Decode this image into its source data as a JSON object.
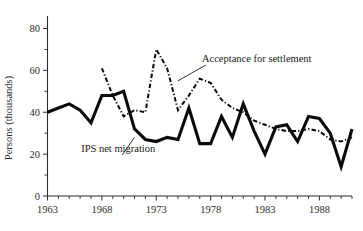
{
  "chart_data": {
    "type": "line",
    "title": "",
    "subtitle": "",
    "xlabel": "",
    "ylabel": "Persons (thousands)",
    "xlim": [
      1963,
      1991
    ],
    "ylim": [
      0,
      85
    ],
    "y_ticks_major": [
      0,
      20,
      40,
      60,
      80
    ],
    "y_ticks_minor": [
      10,
      30,
      50,
      70
    ],
    "y_tick_labels": [
      "0",
      "20",
      "40",
      "60",
      "80"
    ],
    "x_ticks_major": [
      1963,
      1968,
      1973,
      1978,
      1983,
      1988
    ],
    "x_tick_labels": [
      "1963",
      "1968",
      "1973",
      "1978",
      "1983",
      "1988"
    ],
    "x_ticks_minor": [
      1964,
      1965,
      1966,
      1967,
      1969,
      1970,
      1971,
      1972,
      1974,
      1975,
      1976,
      1977,
      1979,
      1980,
      1981,
      1982,
      1984,
      1985,
      1986,
      1987,
      1989,
      1990,
      1991
    ],
    "grid": false,
    "legend_position": "inline-annotations",
    "series": [
      {
        "name": "IPS net migration",
        "style": "solid",
        "color": "#0a0a0a",
        "x": [
          1963,
          1964,
          1965,
          1966,
          1967,
          1968,
          1969,
          1970,
          1971,
          1972,
          1973,
          1974,
          1975,
          1976,
          1977,
          1978,
          1979,
          1980,
          1981,
          1982,
          1983,
          1984,
          1985,
          1986,
          1987,
          1988,
          1989,
          1990,
          1991
        ],
        "values": [
          40,
          42,
          44,
          41,
          35,
          48,
          48,
          50,
          32,
          27,
          26,
          28,
          27,
          42,
          25,
          25,
          38,
          28,
          44,
          31,
          20,
          33,
          34,
          26,
          38,
          37,
          30,
          14,
          32
        ]
      },
      {
        "name": "Acceptance for settlement",
        "style": "dash-dot",
        "color": "#0a0a0a",
        "x": [
          1968,
          1969,
          1970,
          1971,
          1972,
          1973,
          1974,
          1975,
          1976,
          1977,
          1978,
          1979,
          1980,
          1981,
          1982,
          1983,
          1984,
          1985,
          1986,
          1987,
          1988,
          1989,
          1990,
          1991
        ],
        "values": [
          61,
          48,
          38,
          41,
          40,
          70,
          61,
          41,
          48,
          56,
          54,
          46,
          42,
          40,
          36,
          34,
          32,
          31,
          31,
          32,
          31,
          27,
          26,
          28
        ]
      }
    ],
    "annotations": [
      {
        "name": "acceptance-label",
        "text": "Acceptance for settlement",
        "x": 1977.2,
        "y": 64,
        "leader_to": {
          "x": 1975.0,
          "y": 55
        }
      },
      {
        "name": "ips-label",
        "text": "IPS net migration",
        "x": 1969.5,
        "y": 21,
        "leader_to": {
          "x": 1971.0,
          "y": 28
        }
      }
    ]
  },
  "annotations": {
    "acceptance_label": "Acceptance for settlement",
    "ips_label": "IPS net migration"
  },
  "axes": {
    "y_title": "Persons (thousands)"
  },
  "colors": {
    "ink": "#0a0a0a",
    "axis": "#2b2b2b",
    "background": "#ffffff"
  }
}
